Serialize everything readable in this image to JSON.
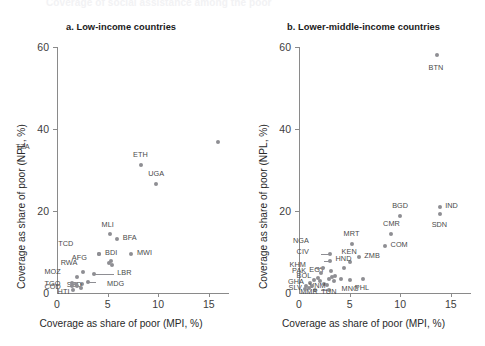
{
  "figure": {
    "cut_off_heading": "Coverage of social assistance among the poor",
    "point_color": "#8e8e93",
    "axis_color": "#8a8a8a",
    "text_color": "#2a2a2a"
  },
  "panels": [
    {
      "id": "a",
      "title": "a. Low-income countries",
      "xlabel": "Coverage as share of poor (MPI, %)",
      "ylabel": "Coverage as share of poor (NPL, %)",
      "xticks": [
        0,
        5,
        10,
        15
      ],
      "yticks": [
        0,
        20,
        40,
        60
      ]
    },
    {
      "id": "b",
      "title": "b. Lower-middle-income countries",
      "xlabel": "Coverage as share of poor (MPI, %)",
      "ylabel": "Coverage as share of poor (NPL, %)",
      "xticks": [
        0,
        5,
        10,
        15
      ],
      "yticks": [
        0,
        20,
        40,
        60
      ]
    }
  ],
  "chart_data": [
    {
      "type": "scatter",
      "panel": "a",
      "title": "a. Low-income countries",
      "xlabel": "Coverage as share of poor (MPI, %)",
      "ylabel": "Coverage as share of poor (NPL, %)",
      "xlim": [
        0,
        17
      ],
      "ylim": [
        0,
        63
      ],
      "grid": false,
      "legend": "none",
      "points": [
        {
          "code": "TZA",
          "x": 15.9,
          "y": 36.8,
          "lx": -19,
          "ly": -1.2
        },
        {
          "code": "ETH",
          "x": 8.3,
          "y": 31.2,
          "lx": -0.1,
          "ly": 2.4
        },
        {
          "code": "UGA",
          "x": 9.8,
          "y": 26.6,
          "lx": -0.1,
          "ly": 2.4
        },
        {
          "code": "MLI",
          "x": 5.2,
          "y": 14.3,
          "lx": -0.1,
          "ly": 2.3
        },
        {
          "code": "BFA",
          "x": 5.9,
          "y": 13.1,
          "lx": 0.6,
          "ly": 0.2
        },
        {
          "code": "MWI",
          "x": 7.3,
          "y": 9.6,
          "lx": 0.6,
          "ly": 0.2
        },
        {
          "code": "BDI",
          "x": 4.2,
          "y": 9.6,
          "lx": 0.55,
          "ly": 0.2
        },
        {
          "code": "TCD",
          "x": 4.2,
          "y": 9.6,
          "lx": -3.1,
          "ly": 2.3
        },
        {
          "code": "AFG",
          "x": 5.15,
          "y": 7.2,
          "lx": -2.7,
          "ly": 1.3
        },
        {
          "code": "CAF",
          "x": 5.35,
          "y": 7.7,
          "lx": null,
          "ly": null
        },
        {
          "code": "NER",
          "x": 5.45,
          "y": 6.8,
          "lx": null,
          "ly": null
        },
        {
          "code": "LBR",
          "x": 3.65,
          "y": 4.7,
          "lx": 2.3,
          "ly": 0.15
        },
        {
          "code": "RWA",
          "x": 2.55,
          "y": 5.2,
          "lx": -1.2,
          "ly": 2.0
        },
        {
          "code": "MOZ",
          "x": 1.95,
          "y": 3.9,
          "lx": -2.2,
          "ly": 1.2
        },
        {
          "code": "MDG",
          "x": 3.05,
          "y": 2.6,
          "lx": 1.9,
          "ly": -0.4
        },
        {
          "code": "SSD",
          "x": 2.45,
          "y": 2.3,
          "lx": -0.5,
          "ly": -0.3
        },
        {
          "code": "TGO",
          "x": 1.45,
          "y": 2.5,
          "lx": -1.7,
          "ly": -0.2
        },
        {
          "code": "COD",
          "x": 1.5,
          "y": 1.6,
          "lx": -1.75,
          "ly": -0.2
        },
        {
          "code": "BEN",
          "x": 1.85,
          "y": 2.1,
          "lx": null,
          "ly": null
        },
        {
          "code": "SLE",
          "x": 2.0,
          "y": 1.7,
          "lx": null,
          "ly": null
        },
        {
          "code": "HTI",
          "x": 1.55,
          "y": 0.7,
          "lx": -0.5,
          "ly": -0.5
        },
        {
          "code": "GNB",
          "x": 2.35,
          "y": 1.2,
          "lx": null,
          "ly": null
        }
      ],
      "leaders": [
        {
          "from": [
            3.65,
            4.7
          ],
          "to": [
            5.6,
            4.7
          ]
        },
        {
          "from": [
            3.05,
            2.6
          ],
          "to": [
            3.9,
            2.6
          ]
        }
      ]
    },
    {
      "type": "scatter",
      "panel": "b",
      "title": "b. Lower-middle-income countries",
      "xlabel": "Coverage as share of poor (MPI, %)",
      "ylabel": "Coverage as share of poor (NPL, %)",
      "xlim": [
        0,
        17
      ],
      "ylim": [
        0,
        63
      ],
      "grid": false,
      "legend": "none",
      "points": [
        {
          "code": "BTN",
          "x": 13.6,
          "y": 58.0,
          "lx": -0.1,
          "ly": -3.0
        },
        {
          "code": "IND",
          "x": 13.9,
          "y": 21.0,
          "lx": 0.55,
          "ly": 0.3
        },
        {
          "code": "SDN",
          "x": 13.9,
          "y": 19.2,
          "lx": -0.1,
          "ly": -2.5
        },
        {
          "code": "BGD",
          "x": 10.0,
          "y": 18.7,
          "lx": -0.1,
          "ly": 2.4
        },
        {
          "code": "CMR",
          "x": 9.1,
          "y": 14.4,
          "lx": -0.1,
          "ly": 2.4
        },
        {
          "code": "COM",
          "x": 8.5,
          "y": 11.5,
          "lx": 0.55,
          "ly": 0.2
        },
        {
          "code": "MRT",
          "x": 5.2,
          "y": 12.0,
          "lx": -0.1,
          "ly": 2.3
        },
        {
          "code": "ZMB",
          "x": 5.9,
          "y": 8.8,
          "lx": 0.55,
          "ly": 0.2
        },
        {
          "code": "KEN",
          "x": 5.0,
          "y": 7.6,
          "lx": -0.1,
          "ly": 2.3
        },
        {
          "code": "HND",
          "x": 4.4,
          "y": 6.0,
          "lx": -0.1,
          "ly": 2.3
        },
        {
          "code": "NGA",
          "x": 3.1,
          "y": 9.5,
          "lx": -2.7,
          "ly": 3.1
        },
        {
          "code": "CIV",
          "x": 3.05,
          "y": 7.9,
          "lx": -2.3,
          "ly": 2.1
        },
        {
          "code": "EGY",
          "x": 3.2,
          "y": 5.3,
          "lx": -1.2,
          "ly": 0.2
        },
        {
          "code": "KHM",
          "x": 2.35,
          "y": 6.0,
          "lx": -2.3,
          "ly": 0.9
        },
        {
          "code": "PAK",
          "x": 2.2,
          "y": 4.8,
          "lx": -1.9,
          "ly": 0.6
        },
        {
          "code": "BOL",
          "x": 1.85,
          "y": 3.6,
          "lx": -1.1,
          "ly": 0.5
        },
        {
          "code": "GHA",
          "x": 1.1,
          "y": 2.4,
          "lx": -1.2,
          "ly": 0.4
        },
        {
          "code": "SLV",
          "x": 0.7,
          "y": 1.6,
          "lx": -0.75,
          "ly": -0.4
        },
        {
          "code": "VNM",
          "x": 2.5,
          "y": 2.3,
          "lx": -0.5,
          "ly": -0.6
        },
        {
          "code": "MMR",
          "x": 1.6,
          "y": 0.8,
          "lx": -0.5,
          "ly": -0.6
        },
        {
          "code": "TUN",
          "x": 3.0,
          "y": 0.8,
          "lx": 0.1,
          "ly": -0.6
        },
        {
          "code": "MNG",
          "x": 5.0,
          "y": 3.2,
          "lx": -0.1,
          "ly": -2.2
        },
        {
          "code": "PHL",
          "x": 6.3,
          "y": 3.4,
          "lx": 0.05,
          "ly": -2.2
        },
        {
          "code": "IDN",
          "x": 3.6,
          "y": 4.2,
          "lx": null,
          "ly": null
        },
        {
          "code": "NPL",
          "x": 3.3,
          "y": 3.9,
          "lx": null,
          "ly": null
        },
        {
          "code": "LAO",
          "x": 3.45,
          "y": 2.9,
          "lx": null,
          "ly": null
        },
        {
          "code": "SEN",
          "x": 2.95,
          "y": 3.4,
          "lx": null,
          "ly": null
        },
        {
          "code": "MAR",
          "x": 2.75,
          "y": 2.0,
          "lx": null,
          "ly": null
        },
        {
          "code": "LKA",
          "x": 2.1,
          "y": 2.9,
          "lx": null,
          "ly": null
        },
        {
          "code": "NIC",
          "x": 1.5,
          "y": 3.1,
          "lx": null,
          "ly": null
        },
        {
          "code": "ZWE",
          "x": 4.15,
          "y": 3.3,
          "lx": null,
          "ly": null
        },
        {
          "code": "TLS",
          "x": 1.3,
          "y": 1.8,
          "lx": null,
          "ly": null
        },
        {
          "code": "BEN",
          "x": 0.95,
          "y": 1.2,
          "lx": null,
          "ly": null
        },
        {
          "code": "AGO",
          "x": 0.55,
          "y": 0.9,
          "lx": null,
          "ly": null
        }
      ],
      "leaders": [
        {
          "from": [
            3.1,
            9.5
          ],
          "to": [
            2.2,
            9.5
          ]
        },
        {
          "from": [
            3.05,
            7.9
          ],
          "to": [
            2.5,
            7.9
          ]
        },
        {
          "from": [
            2.35,
            6.0
          ],
          "to": [
            1.55,
            6.0
          ]
        },
        {
          "from": [
            3.0,
            0.8
          ],
          "to": [
            2.2,
            0.8
          ]
        }
      ]
    }
  ]
}
